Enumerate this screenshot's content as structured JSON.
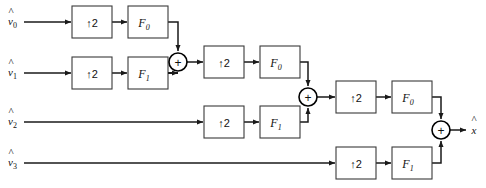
{
  "diagram": {
    "type": "block-diagram",
    "width": 486,
    "height": 188,
    "background_color": "#ffffff",
    "line_color": "#1a1a1a",
    "block_stroke_color": "#3a3a3a",
    "block_fill_color": "#ffffff"
  },
  "inputs": [
    {
      "id": "v0",
      "label": "v",
      "subscript": "0",
      "accent": "^",
      "y": 22
    },
    {
      "id": "v1",
      "label": "v",
      "subscript": "1",
      "accent": "^",
      "y": 73
    },
    {
      "id": "v2",
      "label": "v",
      "subscript": "2",
      "accent": "^",
      "y": 122
    },
    {
      "id": "v3",
      "label": "v",
      "subscript": "3",
      "accent": "^",
      "y": 163
    }
  ],
  "output": {
    "id": "x",
    "label": "x",
    "accent": "^",
    "y": 130
  },
  "upsamplers": [
    {
      "id": "up-r1",
      "label": "2",
      "arrow": "↑",
      "x": 72,
      "y": 6,
      "row": 1
    },
    {
      "id": "up-r2",
      "label": "2",
      "arrow": "↑",
      "x": 72,
      "y": 57,
      "row": 2
    },
    {
      "id": "up-m1",
      "label": "2",
      "arrow": "↑",
      "x": 204,
      "y": 46,
      "row": "mid-1"
    },
    {
      "id": "up-r3",
      "label": "2",
      "arrow": "↑",
      "x": 204,
      "y": 106,
      "row": 3
    },
    {
      "id": "up-m2",
      "label": "2",
      "arrow": "↑",
      "x": 336,
      "y": 81,
      "row": "mid-2"
    },
    {
      "id": "up-r4",
      "label": "2",
      "arrow": "↑",
      "x": 336,
      "y": 147,
      "row": 4
    }
  ],
  "filters": [
    {
      "id": "f-r1",
      "label": "F",
      "subscript": "0",
      "x": 128,
      "y": 6,
      "row": 1
    },
    {
      "id": "f-r2",
      "label": "F",
      "subscript": "1",
      "x": 128,
      "y": 57,
      "row": 2
    },
    {
      "id": "f-m1",
      "label": "F",
      "subscript": "0",
      "x": 260,
      "y": 46,
      "row": "mid-1"
    },
    {
      "id": "f-r3",
      "label": "F",
      "subscript": "1",
      "x": 260,
      "y": 106,
      "row": 3
    },
    {
      "id": "f-m2",
      "label": "F",
      "subscript": "0",
      "x": 392,
      "y": 81,
      "row": "mid-2"
    },
    {
      "id": "f-r4",
      "label": "F",
      "subscript": "1",
      "x": 392,
      "y": 147,
      "row": 4
    }
  ],
  "adders": [
    {
      "id": "sum-1",
      "symbol": "+",
      "cx": 178,
      "cy": 62,
      "r": 9
    },
    {
      "id": "sum-2",
      "symbol": "+",
      "cx": 308,
      "cy": 97,
      "r": 9
    },
    {
      "id": "sum-3",
      "symbol": "+",
      "cx": 441,
      "cy": 130,
      "r": 9
    }
  ],
  "block_size": {
    "width": 40,
    "height": 32
  }
}
